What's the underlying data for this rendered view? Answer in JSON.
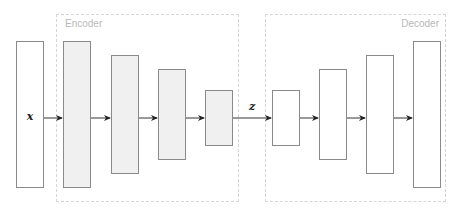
{
  "groups": {
    "encoder": {
      "label": "Encoder",
      "x": 56,
      "y": 14,
      "w": 183,
      "h": 188
    },
    "decoder": {
      "label": "Decoder",
      "x": 265,
      "y": 14,
      "w": 181,
      "h": 188
    }
  },
  "input_label": "x",
  "latent_label": "z",
  "layers": {
    "input": {
      "x": 16,
      "y": 41,
      "w": 28,
      "h": 147
    },
    "encoder": [
      {
        "x": 63,
        "y": 41,
        "w": 28,
        "h": 147
      },
      {
        "x": 111,
        "y": 55,
        "w": 28,
        "h": 119
      },
      {
        "x": 158,
        "y": 69,
        "w": 28,
        "h": 91
      },
      {
        "x": 205,
        "y": 90,
        "w": 28,
        "h": 56
      }
    ],
    "decoder": [
      {
        "x": 272,
        "y": 90,
        "w": 28,
        "h": 56
      },
      {
        "x": 319,
        "y": 69,
        "w": 28,
        "h": 91
      },
      {
        "x": 366,
        "y": 55,
        "w": 28,
        "h": 119
      },
      {
        "x": 413,
        "y": 41,
        "w": 28,
        "h": 147
      }
    ]
  },
  "colors": {
    "encoder_fill": "#f0f0f0",
    "decoder_fill": "#ffffff",
    "stroke": "#8a8a8a",
    "group_border": "#d6d6d6",
    "group_label": "#b8b8b8"
  }
}
